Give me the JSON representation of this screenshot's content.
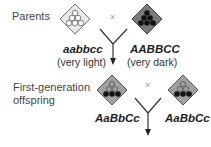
{
  "parents": {
    "label": "Parents",
    "cross_symbol": "×",
    "left": {
      "genotype": "aabbcc",
      "phenotype": "(very light)",
      "icon": "light-diamond-icon"
    },
    "right": {
      "genotype": "AABBCC",
      "phenotype": "(very dark)",
      "icon": "dark-diamond-icon"
    }
  },
  "f1": {
    "label_line1": "First-generation",
    "label_line2": "offspring",
    "cross_symbol": "×",
    "left": {
      "genotype": "AaBbCc",
      "icon": "medium-diamond-icon"
    },
    "right": {
      "genotype": "AaBbCc",
      "icon": "medium-diamond-icon"
    }
  },
  "colors": {
    "light_fill": "#e6e6e6",
    "dark_fill": "#7a7a7a",
    "medium_fill": "#9e9e9e",
    "dot_dark": "#111111",
    "line": "#333333"
  }
}
